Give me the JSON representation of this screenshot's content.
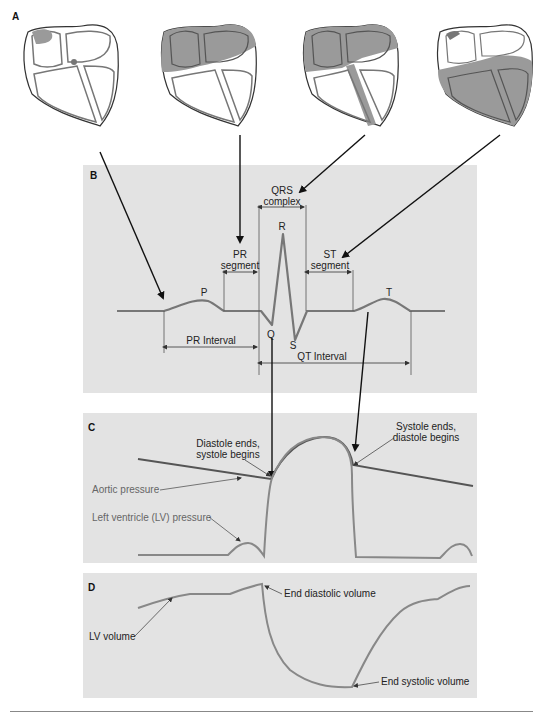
{
  "figure": {
    "panels": {
      "A": {
        "label": "A",
        "description": "Heart cross-sections showing progression of electrical activation (4 stages)"
      },
      "B": {
        "label": "B",
        "waves": {
          "p": "P",
          "q": "Q",
          "r": "R",
          "s": "S",
          "t": "T"
        },
        "annotations": {
          "qrs_line1": "QRS",
          "qrs_line2": "complex",
          "pr_seg_line1": "PR",
          "pr_seg_line2": "segment",
          "st_seg_line1": "ST",
          "st_seg_line2": "segment",
          "pr_interval": "PR Interval",
          "qt_interval": "QT Interval"
        }
      },
      "C": {
        "label": "C",
        "annotations": {
          "diastole_ends_1": "Diastole ends,",
          "diastole_ends_2": "systole begins",
          "systole_ends_1": "Systole ends,",
          "systole_ends_2": "diastole begins",
          "aortic_pressure": "Aortic pressure",
          "lv_pressure": "Left ventricle (LV) pressure"
        }
      },
      "D": {
        "label": "D",
        "annotations": {
          "lv_volume": "LV volume",
          "end_diastolic": "End diastolic volume",
          "end_systolic": "End systolic volume"
        }
      }
    },
    "colors": {
      "panel_bg": "#e3e3e3",
      "trace": "#7a7a7a",
      "arrow": "#111111",
      "heart_fill": "#9a9a9a",
      "heart_dark": "#6e6e6e",
      "aortic_trace": "#555555"
    }
  }
}
